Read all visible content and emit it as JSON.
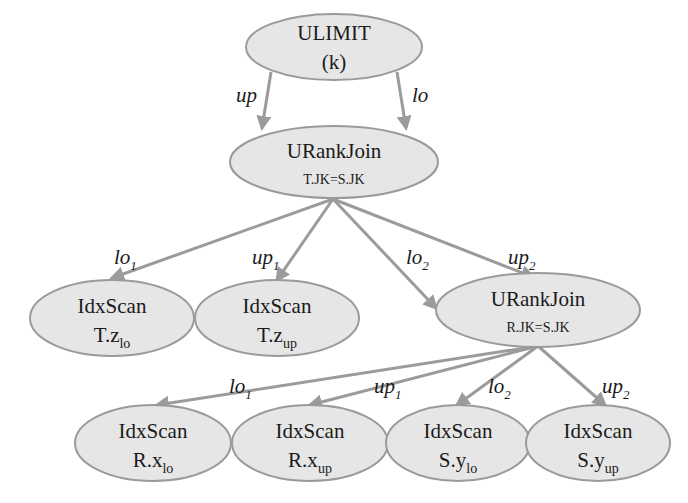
{
  "diagram": {
    "type": "query-plan-tree",
    "colors": {
      "node_fill": "#e6e6e6",
      "node_stroke": "#9a9a9a",
      "edge": "#9b9b9b",
      "text": "#1a1a1a"
    },
    "nodes": {
      "ulimit": {
        "title": "ULIMIT",
        "sub": "(k)"
      },
      "urankjoin_top": {
        "title": "URankJoin",
        "sub": "T.JK=S.JK"
      },
      "idxscan_tz_lo": {
        "title": "IdxScan",
        "sub_base": "T.z",
        "sub_index": "lo"
      },
      "idxscan_tz_up": {
        "title": "IdxScan",
        "sub_base": "T.z",
        "sub_index": "up"
      },
      "urankjoin_bottom": {
        "title": "URankJoin",
        "sub": "R.JK=S.JK"
      },
      "idxscan_rx_lo": {
        "title": "IdxScan",
        "sub_base": "R.x",
        "sub_index": "lo"
      },
      "idxscan_rx_up": {
        "title": "IdxScan",
        "sub_base": "R.x",
        "sub_index": "up"
      },
      "idxscan_sy_lo": {
        "title": "IdxScan",
        "sub_base": "S.y",
        "sub_index": "lo"
      },
      "idxscan_sy_up": {
        "title": "IdxScan",
        "sub_base": "S.y",
        "sub_index": "up"
      }
    },
    "edges": {
      "ulimit_up": {
        "base": "up",
        "index": ""
      },
      "ulimit_lo": {
        "base": "lo",
        "index": ""
      },
      "top_lo1": {
        "base": "lo",
        "index": "1"
      },
      "top_up1": {
        "base": "up",
        "index": "1"
      },
      "top_lo2": {
        "base": "lo",
        "index": "2"
      },
      "top_up2": {
        "base": "up",
        "index": "2"
      },
      "bottom_lo1": {
        "base": "lo",
        "index": "1"
      },
      "bottom_up1": {
        "base": "up",
        "index": "1"
      },
      "bottom_lo2": {
        "base": "lo",
        "index": "2"
      },
      "bottom_up2": {
        "base": "up",
        "index": "2"
      }
    }
  }
}
